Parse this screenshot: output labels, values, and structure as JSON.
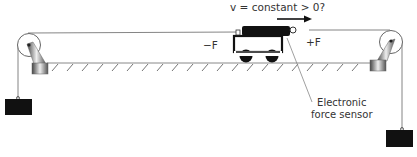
{
  "diagram": {
    "velocity_label": "v = constant > 0?",
    "force_left_label": "−F",
    "force_right_label": "+F",
    "sensor_label_line1": "Electronic",
    "sensor_label_line2": "force sensor",
    "elements": [
      "left-pulley",
      "right-pulley",
      "left-hanging-mass",
      "right-hanging-mass",
      "cart",
      "electronic-force-sensor",
      "velocity-arrow",
      "track-surface"
    ],
    "colors": {
      "line": "#555555",
      "mass": "#111111",
      "text": "#333333"
    }
  }
}
